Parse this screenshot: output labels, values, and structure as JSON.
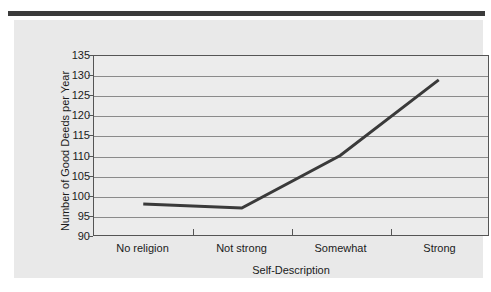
{
  "figure": {
    "background_color": "#e9e9e9",
    "plot_background_color": "#ececec",
    "rule_color": "#3b3b3b",
    "gridline_color": "#8a8a8a",
    "line_color": "#3a3a3a",
    "axis_color": "#555555"
  },
  "chart_data": {
    "type": "line",
    "title": "",
    "xlabel": "Self-Description",
    "ylabel": "Number of Good Deeds per Year",
    "categories": [
      "No religion",
      "Not strong",
      "Somewhat",
      "Strong"
    ],
    "values": [
      97.8,
      96.8,
      110.0,
      129.0
    ],
    "ylim": [
      90,
      135
    ],
    "yticks": [
      90,
      95,
      100,
      105,
      110,
      115,
      120,
      125,
      130,
      135
    ],
    "ytick_labels": [
      "90",
      "95",
      "100",
      "105",
      "110",
      "115",
      "120",
      "125",
      "130",
      "135"
    ],
    "grid": true,
    "legend": false,
    "legend_position": "none",
    "markers": false,
    "line_width": 3
  }
}
